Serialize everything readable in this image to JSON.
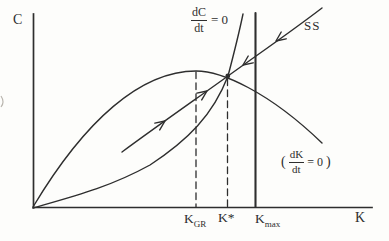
{
  "figure": {
    "type": "phase-diagram",
    "colors": {
      "ink": "#2e2e2e",
      "background": "#fdfdfb",
      "artifact": "#b9b5ae"
    },
    "axes": {
      "y_label": "C",
      "x_label": "K"
    },
    "locus_labels": {
      "dc": {
        "numerator": "dC",
        "denominator": "dt",
        "equals": "= 0"
      },
      "dk": {
        "open_paren": "(",
        "numerator": "dK",
        "denominator": "dt",
        "equals": "= 0",
        "close_paren": ")"
      },
      "saddle": "SS"
    },
    "x_ticks": {
      "kgr": {
        "base": "K",
        "sub": "GR"
      },
      "kstar": "K*",
      "kmax": {
        "base": "K",
        "sub": "max"
      }
    }
  }
}
